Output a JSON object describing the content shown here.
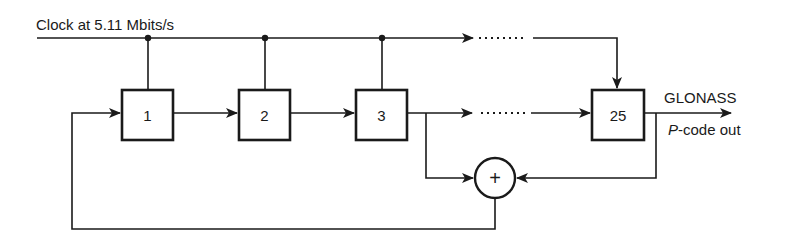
{
  "diagram": {
    "clock_label": "Clock at 5.11  Mbits/s",
    "registers": [
      {
        "label": "1"
      },
      {
        "label": "2"
      },
      {
        "label": "3"
      },
      {
        "label": "25"
      }
    ],
    "xor_symbol": "+",
    "output_label_line1": "GLONASS",
    "output_label_italic": "P",
    "output_label_rest": "-code out",
    "ellipsis": "......."
  },
  "colors": {
    "ink": "#1a1a1a",
    "background": "#ffffff"
  }
}
